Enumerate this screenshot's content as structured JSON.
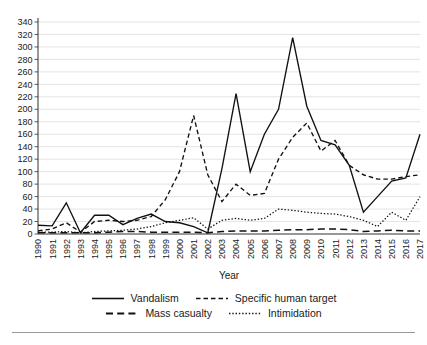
{
  "chart_data": {
    "type": "line",
    "title": "",
    "xlabel": "Year",
    "ylabel": "",
    "grid": true,
    "legend_position": "bottom",
    "ylim": [
      0,
      340
    ],
    "ytick_step": 20,
    "yticks": [
      0,
      20,
      40,
      60,
      80,
      100,
      120,
      140,
      160,
      180,
      200,
      220,
      240,
      260,
      280,
      300,
      320,
      340
    ],
    "categories": [
      1990,
      1991,
      1992,
      1993,
      1994,
      1995,
      1996,
      1997,
      1998,
      1999,
      2000,
      2001,
      2002,
      2003,
      2004,
      2005,
      2006,
      2007,
      2008,
      2009,
      2010,
      2011,
      2012,
      2013,
      2014,
      2015,
      2016,
      2017
    ],
    "series": [
      {
        "name": "Vandalism",
        "style": "solid",
        "values": [
          14,
          13,
          50,
          2,
          30,
          30,
          15,
          25,
          32,
          20,
          18,
          12,
          2,
          105,
          225,
          100,
          160,
          200,
          315,
          205,
          150,
          143,
          110,
          35,
          60,
          85,
          90,
          160
        ]
      },
      {
        "name": "Specific human target",
        "style": "short-dash",
        "values": [
          5,
          8,
          18,
          3,
          20,
          22,
          20,
          22,
          28,
          55,
          100,
          190,
          95,
          52,
          80,
          62,
          65,
          120,
          155,
          178,
          133,
          150,
          110,
          95,
          88,
          88,
          92,
          95
        ]
      },
      {
        "name": "Mass casualty",
        "style": "long-dash",
        "values": [
          2,
          2,
          2,
          2,
          2,
          3,
          4,
          4,
          3,
          3,
          3,
          3,
          2,
          4,
          5,
          5,
          5,
          6,
          7,
          7,
          8,
          8,
          7,
          4,
          5,
          6,
          5,
          5
        ]
      },
      {
        "name": "Intimidation",
        "style": "dotted",
        "values": [
          3,
          3,
          4,
          2,
          4,
          5,
          6,
          8,
          12,
          18,
          22,
          26,
          8,
          22,
          25,
          22,
          25,
          40,
          38,
          35,
          33,
          32,
          28,
          22,
          12,
          35,
          22,
          60
        ]
      }
    ]
  },
  "legend": {
    "rows": [
      [
        {
          "label": "Vandalism",
          "style": "solid"
        },
        {
          "label": "Specific human target",
          "style": "short-dash"
        }
      ],
      [
        {
          "label": "Mass casualty",
          "style": "long-dash"
        },
        {
          "label": "Intimidation",
          "style": "dotted"
        }
      ]
    ]
  },
  "axis": {
    "x_title": "Year"
  },
  "colors": {
    "line": "#111111",
    "grid": "#d2d2d2",
    "axis": "#303030",
    "background": "#ffffff"
  }
}
